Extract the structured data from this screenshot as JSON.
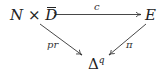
{
  "diagram": {
    "type": "commutative-triangle",
    "nodes": {
      "source": {
        "N": "N",
        "times": "×",
        "D": "D",
        "bar": true
      },
      "target": {
        "label": "E"
      },
      "base": {
        "delta": "Δ",
        "sup": "q"
      }
    },
    "arrows": [
      {
        "from": "source",
        "to": "target",
        "label": "c",
        "style": "monomorphism"
      },
      {
        "from": "source",
        "to": "base",
        "label": "pr",
        "style": "plain"
      },
      {
        "from": "target",
        "to": "base",
        "label": "π",
        "style": "plain"
      }
    ]
  }
}
